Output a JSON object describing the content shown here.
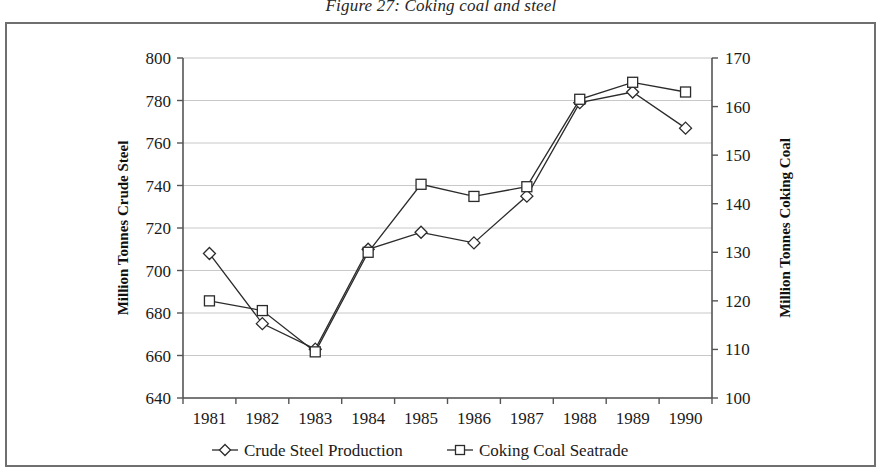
{
  "figure": {
    "title": "Figure 27:  Coking coal and steel",
    "frame_border_color": "#6f6f6f",
    "background": "#ffffff",
    "line_color": "#2b2b2b",
    "grid_color": "#c8c8c8"
  },
  "chart_data": {
    "type": "line",
    "title": "Figure 27:  Coking coal and steel",
    "xlabel": "",
    "ylabel": "Million Tonnes Crude Steel",
    "y2label": "Million Tonnes Coking Coal",
    "categories": [
      "1981",
      "1982",
      "1983",
      "1984",
      "1985",
      "1986",
      "1987",
      "1988",
      "1989",
      "1990"
    ],
    "ylim": [
      640,
      800
    ],
    "yticks": [
      640,
      660,
      680,
      700,
      720,
      740,
      760,
      780,
      800
    ],
    "y2lim": [
      100,
      170
    ],
    "y2ticks": [
      100,
      110,
      120,
      130,
      140,
      150,
      160,
      170
    ],
    "grid": true,
    "legend_position": "bottom",
    "series": [
      {
        "name": "Crude Steel Production",
        "axis": "left",
        "marker": "diamond",
        "values": [
          708,
          675,
          663,
          710,
          718,
          713,
          735,
          779,
          784,
          767
        ]
      },
      {
        "name": "Coking Coal Seatrade",
        "axis": "right",
        "marker": "square",
        "values": [
          120,
          118,
          109.5,
          130,
          144,
          141.5,
          143.5,
          161.5,
          165,
          163
        ]
      }
    ]
  },
  "legend": {
    "items": [
      {
        "label": "Crude Steel Production",
        "marker": "diamond-marker"
      },
      {
        "label": "Coking Coal Seatrade",
        "marker": "square-marker"
      }
    ]
  }
}
